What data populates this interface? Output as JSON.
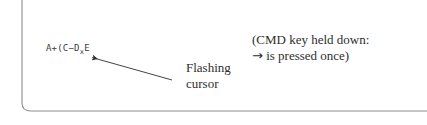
{
  "canvas": {
    "width": 427,
    "height": 125,
    "background": "#ffffff",
    "ink_color": "#2e2e2e",
    "rule_color": "#8d8d8d"
  },
  "screen_frame": {
    "name": "calculator-screen-border",
    "description": "thin rounded L-shaped rule forming left and bottom edge of a calculator display"
  },
  "display": {
    "formula_prefix": "A+(C−D",
    "formula_subscript": "x",
    "formula_suffix": "E",
    "formula_full": "A+(C−D_xE"
  },
  "callout": {
    "line1": "Flashing",
    "line2": "cursor",
    "pointer": {
      "from_x": 172,
      "from_y": 80,
      "to_x": 88,
      "to_y": 56
    }
  },
  "note": {
    "line1": "(CMD key held down:",
    "line2_arrow": "→",
    "line2_rest": " is pressed once)"
  }
}
